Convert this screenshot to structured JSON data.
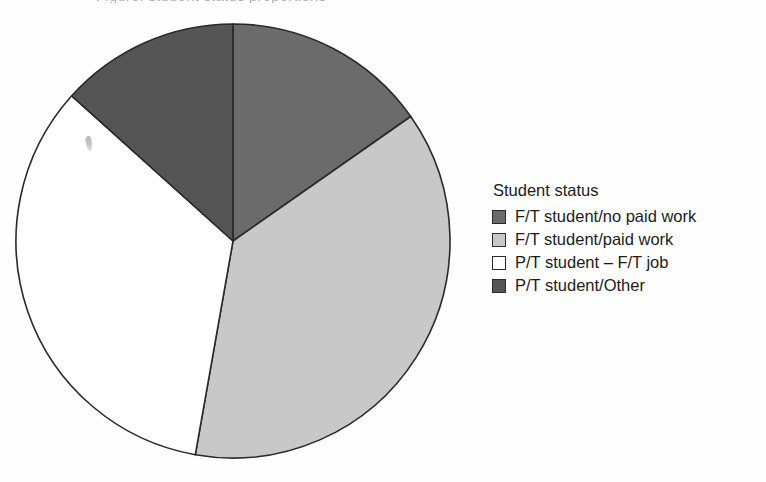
{
  "figure": {
    "background_color": "#fefefe",
    "title_remnant": "Figure: student status proportions"
  },
  "legend": {
    "title": "Student status",
    "items": [
      {
        "label": "F/T student/no paid work",
        "color": "#6b6b6b"
      },
      {
        "label": "F/T student/paid work",
        "color": "#c8c8c8"
      },
      {
        "label": "P/T student – F/T job",
        "color": "#ffffff"
      },
      {
        "label": "P/T student/Other",
        "color": "#555555"
      }
    ]
  },
  "chart_data": {
    "type": "pie",
    "title": "Student status",
    "xlabel": "",
    "ylabel": "",
    "legend_position": "right",
    "grid": false,
    "start_angle_deg": 0,
    "direction": "clockwise",
    "center_px": [
      233,
      241
    ],
    "radius_px": 217,
    "stroke_color": "#2a2a2a",
    "categories": [
      "F/T student/no paid work",
      "F/T student/paid work",
      "P/T student – F/T job",
      "P/T student/Other"
    ],
    "values": [
      15.3,
      37.5,
      33.9,
      13.3
    ],
    "angles_deg": [
      55,
      135,
      122,
      48
    ],
    "colors": [
      "#6b6b6b",
      "#c8c8c8",
      "#ffffff",
      "#555555"
    ]
  }
}
